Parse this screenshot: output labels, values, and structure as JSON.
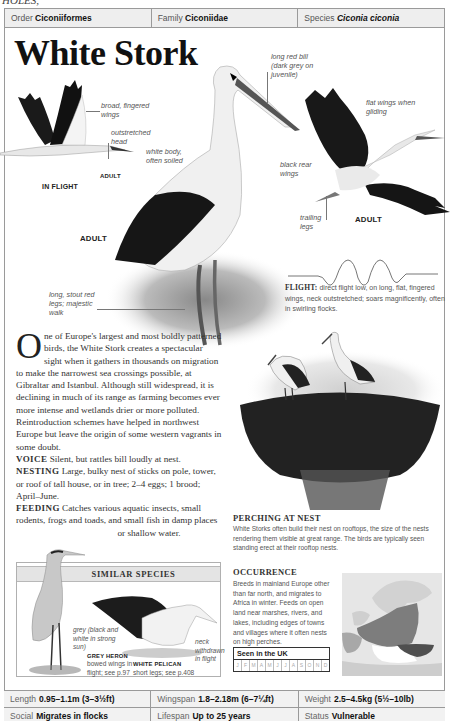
{
  "header_crop_text": "HOLES,",
  "taxonomy": {
    "order_label": "Order",
    "order_value": "Ciconiiformes",
    "family_label": "Family",
    "family_value": "Ciconiidae",
    "species_label": "Species",
    "species_value": "Ciconia ciconia"
  },
  "title": "White Stork",
  "illustration_labels": {
    "broad_wings": "broad, fingered wings",
    "outstretched_head": "outstretched head",
    "adult_small": "ADULT",
    "in_flight": "IN FLIGHT",
    "white_body": "white body, often soiled",
    "long_red_bill": "long red bill (dark grey on juvenile)",
    "flat_wings": "flat wings when gliding",
    "black_rear_wings": "black rear wings",
    "trailing_legs": "trailing legs",
    "adult_flight": "ADULT",
    "adult_standing": "ADULT",
    "long_legs": "long, stout red legs; majestic walk"
  },
  "flight": {
    "label": "FLIGHT:",
    "text": "direct flight low, on long, flat, fingered wings, neck outstretched; soars magnificently, often in swirling flocks."
  },
  "description": {
    "dropcap": "O",
    "intro": "ne of Europe's largest and most boldly patterned birds, the White Stork creates a spectacular sight when it gathers in thousands on migration to make the narrowest sea crossings possible, at Gibraltar and Istanbul. Although still widespread, it is declining in much of its range as farming becomes ever more intense and wetlands drier or more polluted. Reintroduction schemes have helped in northwest Europe but leave the origin of some western vagrants in some doubt.",
    "voice_label": "VOICE",
    "voice_text": "Silent, but rattles bill loudly at nest.",
    "nesting_label": "NESTING",
    "nesting_text": "Large, bulky nest of sticks on pole, tower, or roof of tall house, or in tree; 2–4 eggs; 1 brood; April–June.",
    "feeding_label": "FEEDING",
    "feeding_text": "Catches various aquatic insects, small rodents, frogs and toads, and small fish in damp places",
    "feeding_tail": "or shallow water."
  },
  "similar_species": {
    "heading": "SIMILAR SPECIES",
    "heron_note": "grey (black and white in strong sun)",
    "heron_name": "GREY HERON",
    "heron_desc": "bowed wings in flight; see p.97",
    "pelican_note": "neck withdrawn in flight",
    "pelican_name": "WHITE PELICAN",
    "pelican_desc": "short legs; see p.408"
  },
  "perching": {
    "title": "PERCHING AT NEST",
    "text": "White Storks often build their nest on rooftops, the size of the nests rendering them visible at great range. The birds are typically seen standing erect at their rooftop nests."
  },
  "occurrence": {
    "title": "OCCURRENCE",
    "text": "Breeds in mainland Europe other than far north, and migrates to Africa in winter. Feeds on open land near marshes, rivers, and lakes, including edges of towns and villages where it often nests on high perches."
  },
  "seen_in_uk": {
    "label": "Seen in the UK",
    "months": [
      "J",
      "F",
      "M",
      "A",
      "M",
      "J",
      "J",
      "A",
      "S",
      "O",
      "N",
      "D"
    ]
  },
  "stats": {
    "length_label": "Length",
    "length_value": "0.95–1.1m (3–3½ft)",
    "wingspan_label": "Wingspan",
    "wingspan_value": "1.8–2.18m (6–7¼ft)",
    "weight_label": "Weight",
    "weight_value": "2.5–4.5kg (5½–10lb)",
    "social_label": "Social",
    "social_value": "Migrates in flocks",
    "lifespan_label": "Lifespan",
    "lifespan_value": "Up to 25 years",
    "status_label": "Status",
    "status_value": "Vulnerable"
  },
  "colors": {
    "frame": "#9a9a9a",
    "band_bg": "#eeeeee",
    "text_dark": "#111111",
    "text_muted": "#555555"
  }
}
